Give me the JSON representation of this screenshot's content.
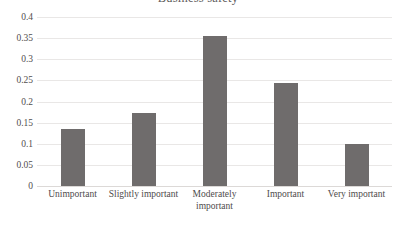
{
  "chart_data": {
    "type": "bar",
    "title": "Business safety",
    "xlabel": "",
    "ylabel": "",
    "categories": [
      "Unimportant",
      "Slightly important",
      "Moderately important",
      "Important",
      "Very important"
    ],
    "values": [
      0.135,
      0.173,
      0.355,
      0.244,
      0.099
    ],
    "ylim": [
      0,
      0.4
    ],
    "ytick_labels": [
      "0.4",
      "0.35",
      "0.3",
      "0.25",
      "0.2",
      "0.15",
      "0.1",
      "0.05",
      "0"
    ],
    "ytick_values": [
      0.4,
      0.35,
      0.3,
      0.25,
      0.2,
      0.15,
      0.1,
      0.05,
      0
    ],
    "grid": true,
    "legend": false,
    "legend_position": "none",
    "bar_color": "#6f6c6c",
    "gridline_color": "#e9e7e6",
    "background_color": "#ffffff"
  }
}
